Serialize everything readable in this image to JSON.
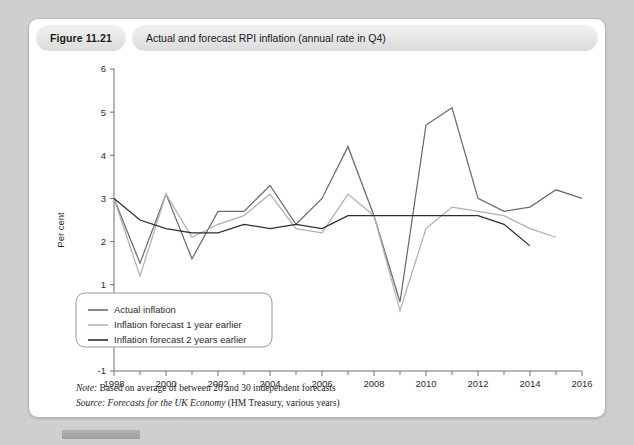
{
  "figure": {
    "number": "Figure 11.21",
    "caption": "Actual and forecast RPI inflation (annual rate in Q4)"
  },
  "notes": {
    "note_label": "Note:",
    "note_text": " Based on average of between 20 and 30 independent forecasts",
    "source_label": "Source:",
    "source_title": " Forecasts for the UK Economy",
    "source_rest": " (HM Treasury, various years)"
  },
  "colors": {
    "actual": "#6b6b6b",
    "forecast1": "#b0b0b0",
    "forecast2": "#2e2e2e",
    "axis": "#6f6f6f",
    "card_background": "#ffffff",
    "page_background": "#cfcfcf",
    "header_pill": "#e4e4e4"
  },
  "chart_data": {
    "type": "line",
    "title": "Actual and forecast RPI inflation (annual rate in Q4)",
    "xlabel": "",
    "ylabel": "Per cent",
    "xlim": [
      1998,
      2016
    ],
    "ylim": [
      -1,
      6
    ],
    "yticks": [
      -1,
      0,
      1,
      2,
      3,
      4,
      5,
      6
    ],
    "xticks": [
      1998,
      2000,
      2002,
      2004,
      2006,
      2008,
      2010,
      2012,
      2014,
      2016
    ],
    "xtick_minor_step": 1,
    "grid": false,
    "legend_position": "lower-left-inside",
    "series": [
      {
        "name": "Actual inflation",
        "color": "#6b6b6b",
        "x": [
          1998,
          1999,
          2000,
          2001,
          2002,
          2003,
          2004,
          2005,
          2006,
          2007,
          2008,
          2009,
          2010,
          2011,
          2012,
          2013,
          2014,
          2015,
          2016
        ],
        "values": [
          3.0,
          1.5,
          3.1,
          1.6,
          2.7,
          2.7,
          3.3,
          2.4,
          3.0,
          4.2,
          2.6,
          0.6,
          4.7,
          5.1,
          3.0,
          2.7,
          2.8,
          3.2,
          3.0
        ]
      },
      {
        "name": "Inflation forecast 1 year earlier",
        "color": "#b0b0b0",
        "x": [
          1998,
          1999,
          2000,
          2001,
          2002,
          2003,
          2004,
          2005,
          2006,
          2007,
          2008,
          2009,
          2010,
          2011,
          2012,
          2013,
          2014,
          2015
        ],
        "values": [
          3.0,
          1.2,
          3.1,
          2.1,
          2.4,
          2.6,
          3.1,
          2.3,
          2.2,
          3.1,
          2.6,
          0.4,
          2.3,
          2.8,
          2.7,
          2.6,
          2.3,
          2.1
        ]
      },
      {
        "name": "Inflation forecast 2 years earlier",
        "color": "#2e2e2e",
        "x": [
          1998,
          1999,
          2000,
          2001,
          2002,
          2003,
          2004,
          2005,
          2006,
          2007,
          2008,
          2009,
          2010,
          2011,
          2012,
          2013,
          2014
        ],
        "values": [
          3.0,
          2.5,
          2.3,
          2.2,
          2.2,
          2.4,
          2.3,
          2.4,
          2.3,
          2.6,
          2.6,
          2.6,
          2.6,
          2.6,
          2.6,
          2.4,
          1.9
        ]
      }
    ]
  },
  "legend": {
    "items": [
      {
        "label": "Actual inflation",
        "color": "#6b6b6b"
      },
      {
        "label": "Inflation forecast 1 year earlier",
        "color": "#b0b0b0"
      },
      {
        "label": "Inflation forecast 2 years earlier",
        "color": "#2e2e2e"
      }
    ]
  }
}
